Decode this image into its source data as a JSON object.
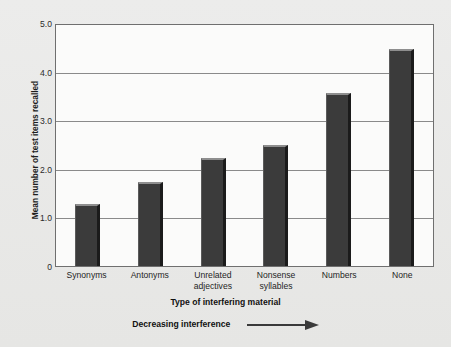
{
  "chart_data": {
    "type": "bar",
    "title": "",
    "xlabel": "Type of interfering material",
    "ylabel": "Mean number of test items recalled",
    "categories": [
      "Synonyms",
      "Antonyms",
      "Unrelated adjectives",
      "Nonsense syllables",
      "Numbers",
      "None"
    ],
    "category_lines": [
      [
        "Synonyms"
      ],
      [
        "Antonyms"
      ],
      [
        "Unrelated",
        "adjectives"
      ],
      [
        "Nonsense",
        "syllables"
      ],
      [
        "Numbers"
      ],
      [
        "None"
      ]
    ],
    "values": [
      1.28,
      1.73,
      2.22,
      2.5,
      3.55,
      4.47
    ],
    "ylim": [
      0,
      5.0
    ],
    "yticks": [
      "0",
      "1.0",
      "2.0",
      "3.0",
      "4.0",
      "5.0"
    ],
    "ytick_values": [
      0,
      1.0,
      2.0,
      3.0,
      4.0,
      5.0
    ],
    "grid": true,
    "legend": "none",
    "annotation": "Decreasing interference",
    "annotation_icon": "right-arrow-icon",
    "bar_color": "#3b3b3b",
    "bar_top_color": "#8e8e8e",
    "bar_side_color": "#1b1b1b",
    "grid_color": "#8a8a8a",
    "plot_background": "#fbfbfa",
    "page_background": "#e9e9e7",
    "axis_color": "#6f6f6f"
  }
}
